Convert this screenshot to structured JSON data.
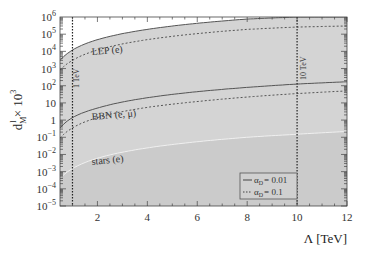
{
  "chart_data": {
    "type": "line",
    "title": "",
    "xlabel": "Λ [TeV]",
    "ylabel": "d^l_M × 10^3",
    "xscale": "linear",
    "yscale": "log",
    "xlim": [
      0.5,
      12
    ],
    "ylim": [
      1e-05,
      1000000.0
    ],
    "x_ticks": [
      2,
      4,
      6,
      8,
      10,
      12
    ],
    "x_tick_labels": [
      "2",
      "4",
      "6",
      "8",
      "10",
      "12"
    ],
    "y_ticks": [
      1e-05,
      0.0001,
      0.001,
      0.01,
      0.1,
      1,
      10,
      100,
      1000,
      10000,
      100000,
      1000000
    ],
    "y_tick_labels": [
      "10^-5",
      "10^-4",
      "10^-3",
      "10^-2",
      "10^-1",
      "1",
      "10",
      "10^2",
      "10^3",
      "10^4",
      "10^5",
      "10^6"
    ],
    "grid": false,
    "x": [
      0.5,
      1,
      2,
      4,
      6,
      8,
      10,
      12
    ],
    "series": [
      {
        "name": "LEP (e), α_D = 0.01",
        "style": "solid",
        "values": [
          3000,
          12000,
          48000,
          190000,
          430000,
          760000,
          1000000,
          1000000
        ]
      },
      {
        "name": "LEP (e), α_D = 0.1",
        "style": "dashed",
        "values": [
          800,
          3000,
          12000,
          48000,
          108000,
          190000,
          260000,
          300000
        ]
      },
      {
        "name": "BBN (e, μ), α_D = 0.01",
        "style": "solid",
        "values": [
          0.35,
          1.4,
          5,
          20,
          45,
          80,
          125,
          170
        ]
      },
      {
        "name": "BBN (e, μ), α_D = 0.1",
        "style": "dashed",
        "values": [
          0.09,
          0.35,
          1.4,
          5.5,
          12,
          22,
          35,
          50
        ]
      },
      {
        "name": "stars (e)",
        "style": "boundary",
        "values": [
          0.0004,
          0.0015,
          0.006,
          0.024,
          0.055,
          0.1,
          0.15,
          0.22
        ]
      }
    ],
    "regions": [
      {
        "label": "LEP (e)",
        "shade": "#d2d2d2"
      },
      {
        "label": "BBN (e, μ)",
        "shade": "#d9d9d9"
      },
      {
        "label": "stars (e)",
        "shade": "#cfcfcf"
      }
    ],
    "reference_lines": [
      {
        "x": 1,
        "label": "1 TeV"
      },
      {
        "x": 10,
        "label": "10 TeV"
      }
    ],
    "legend": {
      "position": "lower right",
      "entries": [
        {
          "style": "solid",
          "label": "α_D = 0.01"
        },
        {
          "style": "dashed",
          "label": "α_D = 0.1"
        }
      ]
    }
  },
  "labels": {
    "x_axis": "Λ [TeV]",
    "y_axis_main": "d",
    "y_axis_sup": "l",
    "y_axis_sub": "M",
    "y_axis_rest": " × 10",
    "y_axis_exp": "3",
    "region_lep": "LEP (e)",
    "region_bbn": "BBN (e, μ)",
    "region_stars": "stars (e)",
    "ref_1": "1 TeV",
    "ref_10": "10 TeV",
    "legend_solid": "= 0.01",
    "legend_dashed": "= 0.1",
    "legend_alpha": "α",
    "legend_sub": "D"
  },
  "colors": {
    "background": "#ffffff",
    "plot_bg": "#ffffff",
    "region_fill": "#d4d4d4",
    "region_fill_low": "#cbcbcb",
    "line": "#555555",
    "axis": "#444444",
    "stars_boundary": "#f0f0f0"
  }
}
